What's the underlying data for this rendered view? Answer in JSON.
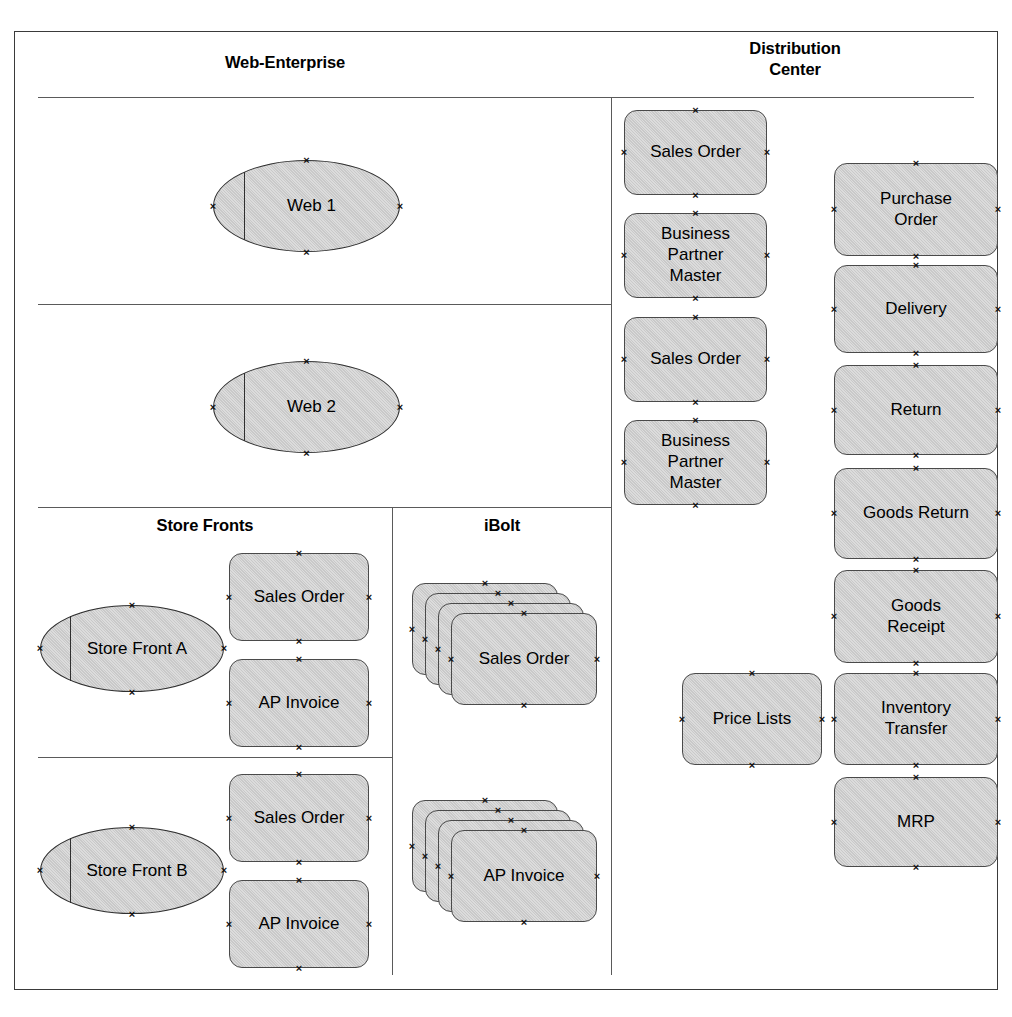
{
  "diagram": {
    "colors": {
      "shape_fill": "#c9c9c9",
      "shape_border": "#4a4a4a",
      "frame_border": "#3a3a3a",
      "rule": "#5a5a5a",
      "text": "#000000",
      "background": "#ffffff"
    }
  },
  "lanes": {
    "web_enterprise": {
      "title": "Web-Enterprise"
    },
    "distribution_center": {
      "title": "Distribution\nCenter"
    },
    "store_fronts": {
      "title": "Store Fronts"
    },
    "ibolt": {
      "title": "iBolt"
    }
  },
  "nodes": {
    "web1": {
      "label": "Web 1",
      "shape": "ellipse"
    },
    "web2": {
      "label": "Web 2",
      "shape": "ellipse"
    },
    "store_front_a": {
      "label": "Store Front A",
      "shape": "ellipse"
    },
    "store_front_b": {
      "label": "Store Front B",
      "shape": "ellipse"
    },
    "sf_a_sales_order": {
      "label": "Sales Order",
      "shape": "rounded-rect"
    },
    "sf_a_ap_invoice": {
      "label": "AP Invoice",
      "shape": "rounded-rect"
    },
    "sf_b_sales_order": {
      "label": "Sales Order",
      "shape": "rounded-rect"
    },
    "sf_b_ap_invoice": {
      "label": "AP Invoice",
      "shape": "rounded-rect"
    },
    "ibolt_sales_order": {
      "label": "Sales Order",
      "shape": "stack",
      "count": 4
    },
    "ibolt_ap_invoice": {
      "label": "AP Invoice",
      "shape": "stack",
      "count": 4
    },
    "dc_sales_order_1": {
      "label": "Sales Order",
      "shape": "rounded-rect"
    },
    "dc_bp_master_1": {
      "label": "Business\nPartner\nMaster",
      "shape": "rounded-rect"
    },
    "dc_sales_order_2": {
      "label": "Sales Order",
      "shape": "rounded-rect"
    },
    "dc_bp_master_2": {
      "label": "Business\nPartner\nMaster",
      "shape": "rounded-rect"
    },
    "dc_purchase_order": {
      "label": "Purchase\nOrder",
      "shape": "rounded-rect"
    },
    "dc_delivery": {
      "label": "Delivery",
      "shape": "rounded-rect"
    },
    "dc_return": {
      "label": "Return",
      "shape": "rounded-rect"
    },
    "dc_goods_return": {
      "label": "Goods Return",
      "shape": "rounded-rect"
    },
    "dc_goods_receipt": {
      "label": "Goods\nReceipt",
      "shape": "rounded-rect"
    },
    "dc_price_lists": {
      "label": "Price Lists",
      "shape": "rounded-rect"
    },
    "dc_inventory_transfer": {
      "label": "Inventory\nTransfer",
      "shape": "rounded-rect"
    },
    "dc_mrp": {
      "label": "MRP",
      "shape": "rounded-rect"
    }
  }
}
